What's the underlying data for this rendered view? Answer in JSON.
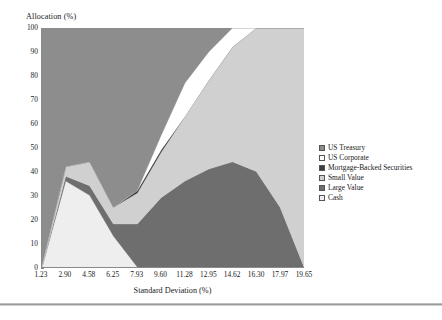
{
  "chart_data": {
    "type": "area",
    "title": "",
    "ylabel": "Allocation (%)",
    "xlabel": "Standard Deviation (%)",
    "stacked": true,
    "grid": false,
    "legend_position": "right",
    "xlim": [
      1.23,
      19.65
    ],
    "ylim": [
      0,
      100
    ],
    "x_tick_labels": [
      "1.23",
      "2.90",
      "4.58",
      "6.25",
      "7.93",
      "9.60",
      "11.28",
      "12.95",
      "14.62",
      "16.30",
      "17.97",
      "19.65"
    ],
    "y_tick_labels": [
      "100",
      "90",
      "80",
      "70",
      "60",
      "50",
      "40",
      "30",
      "20",
      "10",
      "0"
    ],
    "x": [
      1.23,
      2.9,
      4.58,
      6.25,
      7.93,
      9.6,
      11.28,
      12.95,
      14.62,
      16.3,
      17.97,
      19.65
    ],
    "series": [
      {
        "name": "Cash",
        "color": "#eeeeee",
        "values": [
          0,
          36,
          30,
          13,
          0,
          0,
          0,
          0,
          0,
          0,
          0,
          0
        ]
      },
      {
        "name": "Large Value",
        "color": "#6e6e6e",
        "values": [
          0,
          2,
          4,
          5,
          18,
          29,
          36,
          41,
          44,
          40,
          25,
          0
        ]
      },
      {
        "name": "Small Value",
        "color": "#d0d0d0",
        "values": [
          1,
          4,
          10,
          7,
          13,
          19,
          27,
          37,
          48,
          60,
          75,
          100
        ]
      },
      {
        "name": "Mortgage-Backed Securities",
        "color": "#3d3d3d",
        "values": [
          0,
          0,
          0,
          0,
          1,
          1,
          0,
          0,
          0,
          0,
          0,
          0
        ]
      },
      {
        "name": "US Corporate",
        "color": "#ffffff",
        "values": [
          0,
          0,
          0,
          0,
          0,
          6,
          14,
          12,
          8,
          0,
          0,
          0
        ]
      },
      {
        "name": "US Treasury",
        "color": "#8d8d8d",
        "values": [
          99,
          58,
          56,
          75,
          68,
          45,
          23,
          10,
          0,
          0,
          0,
          0
        ]
      }
    ]
  },
  "legend": {
    "items": [
      {
        "label": "US Treasury",
        "color": "#8d8d8d"
      },
      {
        "label": "US Corporate",
        "color": "#ffffff"
      },
      {
        "label": "Mortgage-Backed Securities",
        "color": "#3d3d3d"
      },
      {
        "label": "Small Value",
        "color": "#d0d0d0"
      },
      {
        "label": "Large Value",
        "color": "#6e6e6e"
      },
      {
        "label": "Cash",
        "color": "#eeeeee"
      }
    ]
  }
}
